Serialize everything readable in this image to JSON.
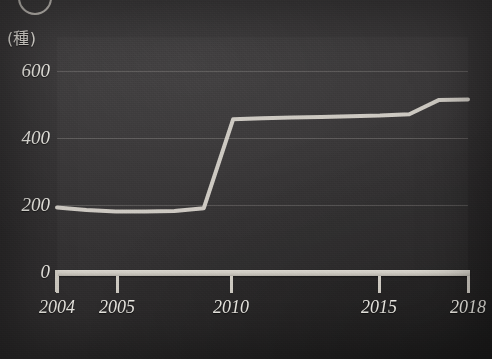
{
  "figure": {
    "marker_icon": "circled-number-marker",
    "unit_label": "(種)"
  },
  "chart_data": {
    "type": "line",
    "title": "",
    "subtitle": "",
    "xlabel": "",
    "ylabel": "(種)",
    "unit": "種",
    "grid": true,
    "legend": "none",
    "xlim": [
      2004,
      2018
    ],
    "ylim": [
      0,
      700
    ],
    "yticks": [
      0,
      200,
      400,
      600
    ],
    "ytick_labels": [
      "0",
      "200",
      "400",
      "600"
    ],
    "xticks": [
      2004,
      2005,
      2010,
      2015,
      2018
    ],
    "xtick_labels": [
      "2004",
      "2005",
      "2010",
      "2015",
      "2018"
    ],
    "xtick_px": [
      57,
      117,
      231,
      379,
      468
    ],
    "x": [
      2004,
      2005,
      2006,
      2007,
      2008,
      2009,
      2010,
      2011,
      2012,
      2013,
      2014,
      2015,
      2016,
      2017,
      2018
    ],
    "values": [
      192,
      185,
      180,
      180,
      182,
      190,
      455,
      458,
      460,
      462,
      464,
      466,
      470,
      512,
      514
    ],
    "series": [
      {
        "name": "種数",
        "color": "#d8d4cc",
        "values": [
          192,
          185,
          180,
          180,
          182,
          190,
          455,
          458,
          460,
          462,
          464,
          466,
          470,
          512,
          514
        ]
      }
    ],
    "annotations": []
  },
  "colors": {
    "background": "#333132",
    "line": "#d8d4cc",
    "axis": "#cdc9c1",
    "grid": "#e6e2da",
    "text": "#eceae4"
  }
}
